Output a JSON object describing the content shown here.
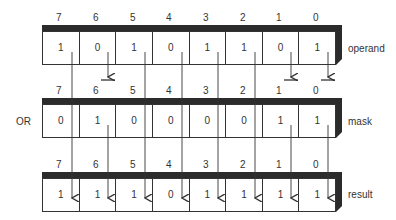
{
  "operation": "OR",
  "bit_indices": [
    "7",
    "6",
    "5",
    "4",
    "3",
    "2",
    "1",
    "0"
  ],
  "registers": {
    "operand": {
      "label": "operand",
      "bits": [
        "1",
        "0",
        "1",
        "0",
        "1",
        "1",
        "0",
        "1"
      ]
    },
    "mask": {
      "label": "mask",
      "bits": [
        "0",
        "1",
        "0",
        "0",
        "0",
        "0",
        "1",
        "1"
      ]
    },
    "result": {
      "label": "result",
      "bits": [
        "1",
        "1",
        "1",
        "0",
        "1",
        "1",
        "1",
        "1"
      ]
    }
  },
  "colors": {
    "line": "#333333",
    "bar": "#2b2b2b"
  }
}
